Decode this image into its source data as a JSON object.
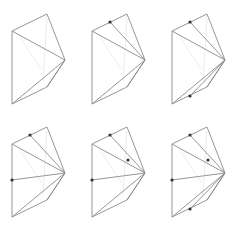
{
  "diagram": {
    "title": "",
    "colors": {
      "edge": "#8a8a8a",
      "faint": "#e6e6e6",
      "point": "#333333",
      "background": "#ffffff"
    },
    "base_polygon": [
      [
        12,
        31
      ],
      [
        47,
        14
      ],
      [
        65,
        60
      ],
      [
        47,
        87
      ],
      [
        12,
        104
      ]
    ],
    "apex": [
      65,
      60
    ],
    "panels": [
      {
        "id": 1,
        "offset": [
          0,
          0
        ],
        "points": [],
        "fan_targets": [
          [
            12,
            31
          ],
          [
            12,
            104
          ],
          [
            47,
            87
          ]
        ]
      },
      {
        "id": 2,
        "offset": [
          80,
          0
        ],
        "points": [
          [
            30,
            22
          ]
        ],
        "fan_targets": [
          [
            12,
            31
          ],
          [
            30,
            22
          ],
          [
            12,
            104
          ],
          [
            47,
            87
          ]
        ]
      },
      {
        "id": 3,
        "offset": [
          160,
          0
        ],
        "points": [
          [
            30,
            22
          ],
          [
            30,
            96
          ]
        ],
        "fan_targets": [
          [
            12,
            31
          ],
          [
            30,
            22
          ],
          [
            12,
            104
          ],
          [
            30,
            96
          ],
          [
            47,
            87
          ]
        ]
      },
      {
        "id": 4,
        "offset": [
          0,
          113
        ],
        "points": [
          [
            30,
            22
          ],
          [
            12,
            67
          ]
        ],
        "fan_targets": [
          [
            12,
            31
          ],
          [
            30,
            22
          ],
          [
            12,
            67
          ],
          [
            12,
            104
          ],
          [
            47,
            87
          ]
        ]
      },
      {
        "id": 5,
        "offset": [
          80,
          113
        ],
        "points": [
          [
            30,
            22
          ],
          [
            12,
            67
          ],
          [
            48,
            47
          ]
        ],
        "fan_targets": [
          [
            12,
            31
          ],
          [
            30,
            22
          ],
          [
            12,
            67
          ],
          [
            12,
            104
          ],
          [
            47,
            87
          ]
        ]
      },
      {
        "id": 6,
        "offset": [
          160,
          113
        ],
        "points": [
          [
            30,
            22
          ],
          [
            12,
            67
          ],
          [
            48,
            47
          ],
          [
            30,
            96
          ]
        ],
        "fan_targets": [
          [
            12,
            31
          ],
          [
            30,
            22
          ],
          [
            12,
            67
          ],
          [
            12,
            104
          ],
          [
            30,
            96
          ],
          [
            47,
            87
          ]
        ]
      }
    ]
  }
}
